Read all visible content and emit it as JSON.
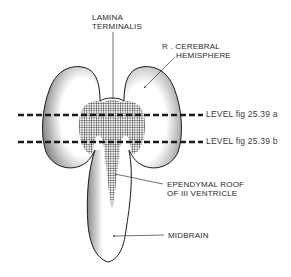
{
  "figure": {
    "type": "anatomical-diagram"
  },
  "labels": {
    "lamina_terminalis": [
      "LAMINA",
      "TERMINALIS"
    ],
    "cerebral_hemisphere": [
      "R . CEREBRAL",
      "HEMISPHERE"
    ],
    "level_a": "LEVEL  fig 25.39 a",
    "level_b": "LEVEL  fig 25.39 b",
    "ependymal_roof": [
      "EPENDYMAL  ROOF",
      "OF III VENTRICLE"
    ],
    "midbrain": "MIDBRAIN"
  },
  "colors": {
    "ink": "#1a1a1a",
    "stipple": "#555555",
    "background": "#ffffff"
  }
}
